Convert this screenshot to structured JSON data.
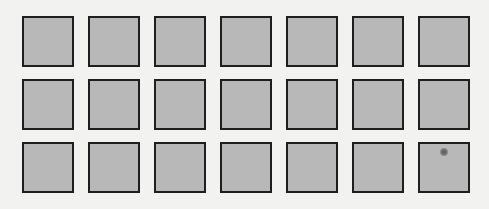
{
  "grid": {
    "rows": 3,
    "columns": 7,
    "cell_fill": "#b8b8b8",
    "cell_border": "#1e1e1e",
    "background": "#f2f2f0",
    "marked_cell": {
      "row": 3,
      "column": 7,
      "mark": "dark-smudge"
    }
  }
}
